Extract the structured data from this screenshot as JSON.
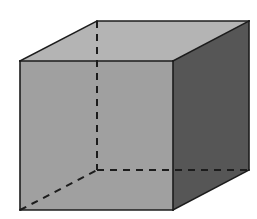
{
  "figure": {
    "title": "Shaded cuboid in oblique projection",
    "type": "3d-solid-line-drawing",
    "background_color": "#ffffff",
    "canvas": {
      "width": 257,
      "height": 219
    },
    "vertices": {
      "front_top_left": [
        20,
        61
      ],
      "front_top_right": [
        173,
        61
      ],
      "front_bottom_right": [
        173,
        210
      ],
      "front_bottom_left": [
        20,
        210
      ],
      "back_top_left": [
        97,
        21
      ],
      "back_top_right": [
        249,
        21
      ],
      "back_bottom_right": [
        249,
        170
      ],
      "back_bottom_left": [
        97,
        170
      ]
    },
    "faces": [
      {
        "name": "top-face",
        "label": "top",
        "fill": "#b4b4b4",
        "points": "20,61 97,21 249,21 173,61"
      },
      {
        "name": "front-face",
        "label": "front",
        "fill": "#a0a0a0",
        "points": "20,61 173,61 173,210 20,210"
      },
      {
        "name": "right-face",
        "label": "right",
        "fill": "#565656",
        "points": "173,61 249,21 249,170 173,210"
      }
    ],
    "visible_edges": [
      {
        "name": "edge-front-top",
        "points": "20,61 173,61"
      },
      {
        "name": "edge-front-left",
        "points": "20,61 20,210"
      },
      {
        "name": "edge-front-bottom",
        "points": "20,210 173,210"
      },
      {
        "name": "edge-front-right",
        "points": "173,61 173,210"
      },
      {
        "name": "edge-top-left-slant",
        "points": "20,61 97,21"
      },
      {
        "name": "edge-top-back",
        "points": "97,21 249,21"
      },
      {
        "name": "edge-top-right-slant",
        "points": "173,61 249,21"
      },
      {
        "name": "edge-right-back",
        "points": "249,21 249,170"
      },
      {
        "name": "edge-bottom-right-slant",
        "points": "173,210 249,170"
      }
    ],
    "hidden_edges": [
      {
        "name": "hidden-edge-back-vertical",
        "points": "97,21 97,170"
      },
      {
        "name": "hidden-edge-back-bottom",
        "points": "97,170 249,170"
      },
      {
        "name": "hidden-edge-bottom-left-slant",
        "points": "20,210 97,170"
      }
    ],
    "style": {
      "edge_color": "#1c1c1c",
      "edge_width": 1.6,
      "hidden_edge_color": "#1c1c1c",
      "hidden_edge_width": 2.0,
      "hidden_dash_pattern": "7,6"
    }
  }
}
